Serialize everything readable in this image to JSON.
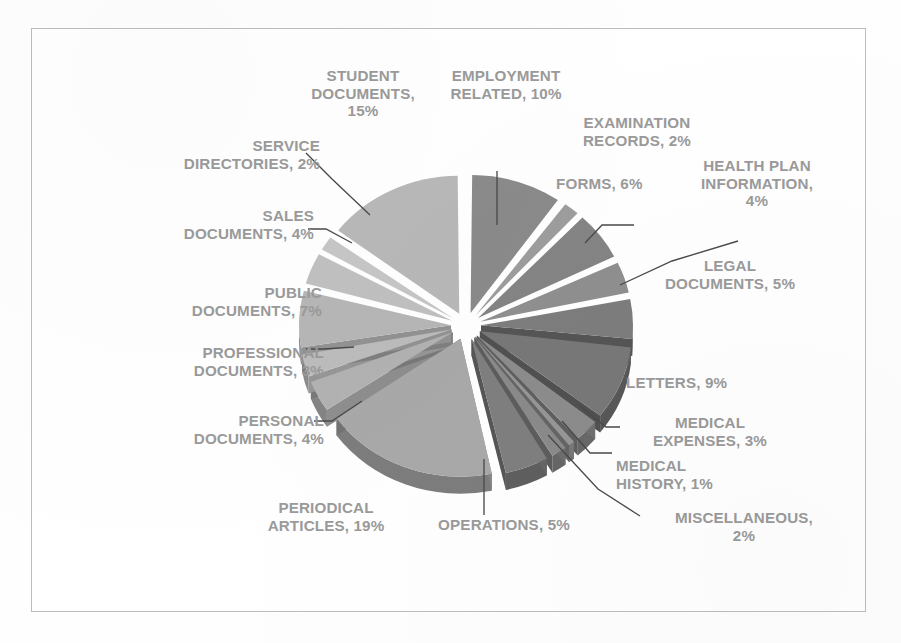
{
  "figure": {
    "background_color": "#ffffff",
    "frame_color": "#b9bcc0",
    "label_color": "#9a9a9a",
    "leader_color": "#4a4a4a"
  },
  "chart_data": {
    "type": "pie",
    "title": "",
    "subtitle": "",
    "xlabel": "",
    "ylabel": "",
    "legend_position": "none",
    "grid": false,
    "style": "exploded 3-D pie, grayscale, scanned document",
    "value_unit": "percent",
    "labels_show_category_and_percent": true,
    "total_percent": 101,
    "categories": [
      "EMPLOYMENT RELATED",
      "EXAMINATION RECORDS",
      "FORMS",
      "HEALTH PLAN INFORMATION",
      "LEGAL DOCUMENTS",
      "LETTERS",
      "MEDICAL EXPENSES",
      "MEDICAL HISTORY",
      "MISCELLANEOUS",
      "OPERATIONS",
      "PERIODICAL ARTICLES",
      "PERSONAL DOCUMENTS",
      "PROFESSIONAL DOCUMENTS",
      "PUBLIC DOCUMENTS",
      "SALES DOCUMENTS",
      "SERVICE DIRECTORIES",
      "STUDENT DOCUMENTS"
    ],
    "values": [
      10,
      2,
      6,
      4,
      5,
      9,
      3,
      1,
      2,
      5,
      19,
      4,
      3,
      7,
      4,
      2,
      15
    ],
    "slice_colors": [
      "#8a8a8a",
      "#9d9d9d",
      "#848484",
      "#8f8f8f",
      "#7d7d7d",
      "#787878",
      "#8c8c8c",
      "#969696",
      "#8a8a8a",
      "#7f7f7f",
      "#a9a9a9",
      "#b2b2b2",
      "#bcbcbc",
      "#b6b6b6",
      "#c0c0c0",
      "#c6c6c6",
      "#b8b8b8"
    ],
    "slices": [
      {
        "label": "EMPLOYMENT RELATED, 10%",
        "category": "EMPLOYMENT RELATED",
        "value": 10
      },
      {
        "label": "EXAMINATION RECORDS, 2%",
        "category": "EXAMINATION RECORDS",
        "value": 2
      },
      {
        "label": "FORMS, 6%",
        "category": "FORMS",
        "value": 6
      },
      {
        "label": "HEALTH PLAN INFORMATION, 4%",
        "category": "HEALTH PLAN INFORMATION",
        "value": 4
      },
      {
        "label": "LEGAL DOCUMENTS, 5%",
        "category": "LEGAL DOCUMENTS",
        "value": 5
      },
      {
        "label": "LETTERS, 9%",
        "category": "LETTERS",
        "value": 9
      },
      {
        "label": "MEDICAL EXPENSES, 3%",
        "category": "MEDICAL EXPENSES",
        "value": 3
      },
      {
        "label": "MEDICAL HISTORY, 1%",
        "category": "MEDICAL HISTORY",
        "value": 1
      },
      {
        "label": "MISCELLANEOUS, 2%",
        "category": "MISCELLANEOUS",
        "value": 2
      },
      {
        "label": "OPERATIONS, 5%",
        "category": "OPERATIONS",
        "value": 5
      },
      {
        "label": "PERIODICAL ARTICLES, 19%",
        "category": "PERIODICAL ARTICLES",
        "value": 19
      },
      {
        "label": "PERSONAL DOCUMENTS, 4%",
        "category": "PERSONAL DOCUMENTS",
        "value": 4
      },
      {
        "label": "PROFESSIONAL DOCUMENTS, 3%",
        "category": "PROFESSIONAL DOCUMENTS",
        "value": 3
      },
      {
        "label": "PUBLIC DOCUMENTS, 7%",
        "category": "PUBLIC DOCUMENTS",
        "value": 7
      },
      {
        "label": "SALES DOCUMENTS, 4%",
        "category": "SALES DOCUMENTS",
        "value": 4
      },
      {
        "label": "SERVICE DIRECTORIES, 2%",
        "category": "SERVICE DIRECTORIES",
        "value": 2
      },
      {
        "label": "STUDENT DOCUMENTS, 15%",
        "category": "STUDENT DOCUMENTS",
        "value": 15
      }
    ]
  },
  "labels": {
    "student_documents": "STUDENT\nDOCUMENTS,\n15%",
    "employment_related": "EMPLOYMENT\nRELATED, 10%",
    "examination_records": "EXAMINATION\nRECORDS, 2%",
    "forms": "FORMS, 6%",
    "health_plan_information": "HEALTH PLAN\nINFORMATION,\n4%",
    "legal_documents": "LEGAL\nDOCUMENTS, 5%",
    "letters": "LETTERS, 9%",
    "medical_expenses": "MEDICAL\nEXPENSES, 3%",
    "medical_history": "MEDICAL\nHISTORY, 1%",
    "miscellaneous": "MISCELLANEOUS,\n2%",
    "operations": "OPERATIONS, 5%",
    "periodical_articles": "PERIODICAL\nARTICLES, 19%",
    "personal_documents": "PERSONAL\nDOCUMENTS, 4%",
    "professional_documents": "PROFESSIONAL\nDOCUMENTS, 3%",
    "public_documents": "PUBLIC\nDOCUMENTS, 7%",
    "sales_documents": "SALES\nDOCUMENTS, 4%",
    "service_directories": "SERVICE\nDIRECTORIES, 2%"
  }
}
